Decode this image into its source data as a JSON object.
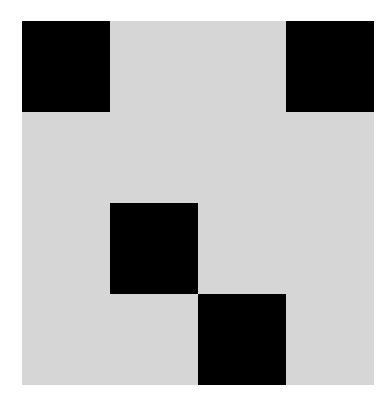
{
  "board": {
    "rows": 4,
    "cols": 4,
    "colors": {
      "empty": "#d6d6d6",
      "filled": "#000000",
      "background": "#ffffff"
    },
    "cells": [
      [
        1,
        0,
        0,
        1
      ],
      [
        0,
        0,
        0,
        0
      ],
      [
        0,
        1,
        0,
        0
      ],
      [
        0,
        0,
        1,
        0
      ]
    ]
  }
}
